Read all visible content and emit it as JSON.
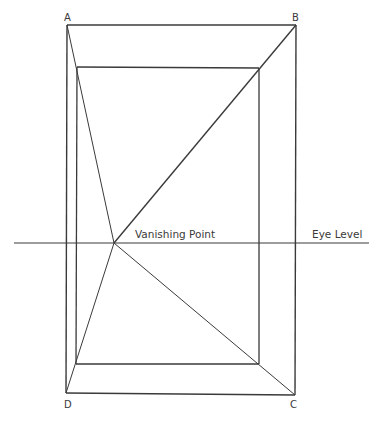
{
  "diagram": {
    "corner_labels": {
      "a": "A",
      "b": "B",
      "c": "C",
      "d": "D"
    },
    "vanishing_point_label": "Vanishing Point",
    "eye_level_label": "Eye Level",
    "colors": {
      "line": "#3a3a3a",
      "background": "#ffffff"
    }
  }
}
